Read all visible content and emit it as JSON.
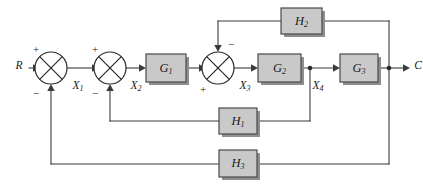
{
  "diagram": {
    "type": "control-system-block-diagram",
    "title": "",
    "colors": {
      "block_fill": "#c9c9c9",
      "block_stroke": "#4a4a4a",
      "wire": "#3b3b3b",
      "text": "#1a1a1a",
      "background": "#ffffff"
    },
    "input_label": "R",
    "output_label": "C",
    "signals": [
      {
        "id": "x1",
        "label": "X",
        "sub": "1"
      },
      {
        "id": "x2",
        "label": "X",
        "sub": "2"
      },
      {
        "id": "x3",
        "label": "X",
        "sub": "3"
      },
      {
        "id": "x4",
        "label": "X",
        "sub": "4"
      }
    ],
    "blocks": [
      {
        "id": "g1",
        "label": "G",
        "sub": "1",
        "x": 146,
        "y": 54,
        "w": 40,
        "h": 28
      },
      {
        "id": "g2",
        "label": "G",
        "sub": "2",
        "x": 258,
        "y": 54,
        "w": 43,
        "h": 28
      },
      {
        "id": "g3",
        "label": "G",
        "sub": "3",
        "x": 340,
        "y": 54,
        "w": 38,
        "h": 28
      },
      {
        "id": "h1",
        "label": "H",
        "sub": "1",
        "x": 219,
        "y": 108,
        "w": 38,
        "h": 26
      },
      {
        "id": "h2",
        "label": "H",
        "sub": "2",
        "x": 281,
        "y": 8,
        "w": 41,
        "h": 26
      },
      {
        "id": "h3",
        "label": "H",
        "sub": "3",
        "x": 219,
        "y": 150,
        "w": 38,
        "h": 27
      }
    ],
    "summing_junctions": [
      {
        "id": "sum1",
        "cx": 51,
        "cy": 68,
        "r": 16,
        "signs": [
          {
            "label": "+",
            "position": "top-left"
          },
          {
            "label": "−",
            "position": "bottom-left"
          }
        ]
      },
      {
        "id": "sum2",
        "cx": 110,
        "cy": 68,
        "r": 16,
        "signs": [
          {
            "label": "+",
            "position": "top-left"
          },
          {
            "label": "−",
            "position": "bottom-left"
          }
        ]
      },
      {
        "id": "sum3",
        "cx": 218,
        "cy": 68,
        "r": 16,
        "signs": [
          {
            "label": "−",
            "position": "top-right"
          },
          {
            "label": "+",
            "position": "bottom-left"
          }
        ]
      }
    ],
    "signs": {
      "plus": "+",
      "minus": "−"
    },
    "feedback_paths": [
      {
        "id": "h2-path",
        "from": "output",
        "to": "sum3",
        "block": "h2",
        "sign": "−"
      },
      {
        "id": "h1-path",
        "from": "x4",
        "to": "sum2",
        "block": "h1",
        "sign": "−"
      },
      {
        "id": "h3-path",
        "from": "output",
        "to": "sum1",
        "block": "h3",
        "sign": "−"
      }
    ]
  }
}
